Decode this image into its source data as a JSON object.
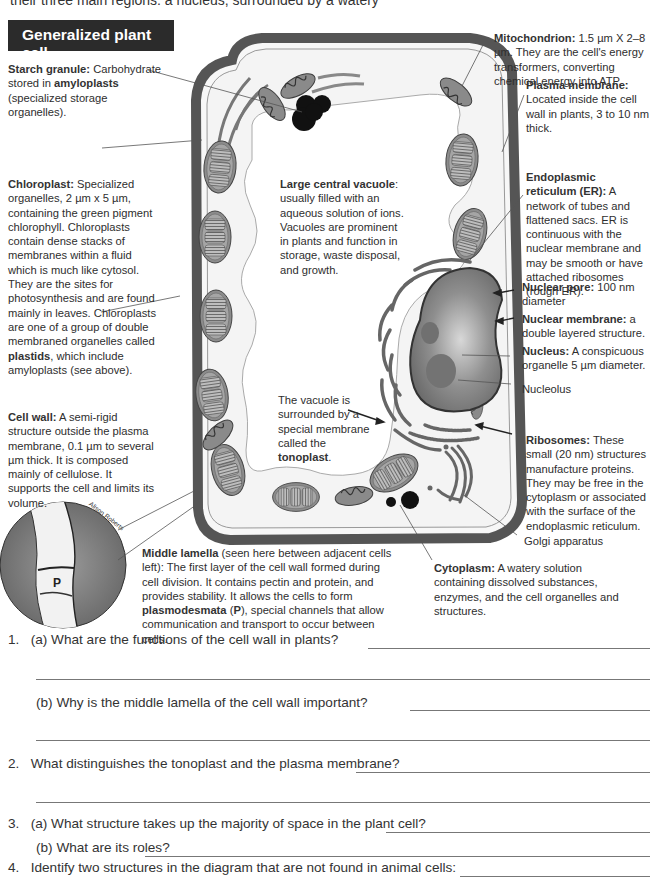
{
  "intro_text": "their three main regions: a nucleus, surrounded by a watery",
  "title": "Generalized plant cell",
  "labels": {
    "starch_granule": {
      "term": "Starch granule:",
      "text_before": " Carbohydrate stored in ",
      "bold": "amyloplasts",
      "text_after": " (specialized storage organelles)."
    },
    "chloroplast": {
      "term": "Chloroplast:",
      "text_before": " Specialized organelles, 2 µm x 5 µm, containing the green pigment chlorophyll. Chloroplasts contain dense stacks of membranes within a fluid which is much like cytosol. They are the sites for photosynthesis and are found mainly in leaves. Chloroplasts are one of a group of double membraned organelles called ",
      "bold": "plastids",
      "text_after": ", which include amyloplasts (see above)."
    },
    "cell_wall": {
      "term": "Cell wall:",
      "text": " A semi-rigid structure outside the plasma membrane, 0.1 µm to several µm thick. It is composed mainly of cellulose. It supports the cell and limits its volume."
    },
    "vacuole": {
      "term": "Large central vacuole",
      "text": ": usually filled with an aqueous solution of ions. Vacuoles are prominent in plants and function in storage, waste disposal, and growth."
    },
    "tonoplast": {
      "text_before": "The vacuole is surrounded by a special membrane called the ",
      "bold": "tonoplast",
      "text_after": "."
    },
    "mitochondrion": {
      "term": "Mitochondrion:",
      "text": " 1.5 µm X 2–8 µm. They are the cell's energy transformers, converting chemical energy into ATP."
    },
    "plasma_membrane": {
      "term": "Plasma membrane:",
      "text": " Located inside the cell wall in plants, 3 to 10 nm thick."
    },
    "er": {
      "term": "Endoplasmic reticulum (ER):",
      "text": " A network of tubes and flattened sacs. ER is continuous with the nuclear membrane and may be smooth or have attached ribosomes (rough ER)."
    },
    "nuclear_pore": {
      "term": "Nuclear pore:",
      "text": " 100 nm diameter"
    },
    "nuclear_membrane": {
      "term": "Nuclear membrane:",
      "text": " a double layered structure."
    },
    "nucleus": {
      "term": "Nucleus:",
      "text": " A conspicuous organelle 5 µm diameter."
    },
    "nucleolus": {
      "text": "Nucleolus"
    },
    "ribosomes": {
      "term": "Ribosomes:",
      "text": " These small (20 nm) structures manufacture proteins. They may be free in the cytoplasm or associated with the surface of the endoplasmic reticulum."
    },
    "golgi": {
      "text": "Golgi apparatus"
    },
    "cytoplasm": {
      "term": "Cytoplasm:",
      "text": " A watery solution containing dissolved substances, enzymes, and the cell organelles and structures."
    },
    "middle_lamella": {
      "term": "Middle lamella",
      "text_before": " (seen here between adjacent cells left): The first layer of the cell wall formed during cell division. It contains pectin and protein, and provides stability. It allows the cells to form ",
      "bold": "plasmodesmata",
      "text_mid": " (",
      "bold2": "P",
      "text_after": "), special channels that allow communication and transport to occur between cells."
    }
  },
  "micrograph": {
    "label": "P",
    "credit": "Alison Roberts"
  },
  "questions": [
    {
      "number": "1.",
      "part": "(a)",
      "text": "What are the functions of the cell wall in plants?"
    },
    {
      "number": "",
      "part": "(b)",
      "text": "Why is the middle lamella of the cell wall important?"
    },
    {
      "number": "2.",
      "part": "",
      "text": "What distinguishes the tonoplast and the plasma membrane?"
    },
    {
      "number": "3.",
      "part": "(a)",
      "text": "What structure takes up the majority of space in the plant cell?"
    },
    {
      "number": "",
      "part": "(b)",
      "text": "What are its roles?"
    },
    {
      "number": "4.",
      "part": "",
      "text": "Identify two structures in the diagram that are not found in animal cells:"
    }
  ],
  "colors": {
    "title_bg": "#2b2b2b",
    "cell_wall": "#555555",
    "organelle_fill": "#8a8a8a",
    "starch": "#111111"
  }
}
